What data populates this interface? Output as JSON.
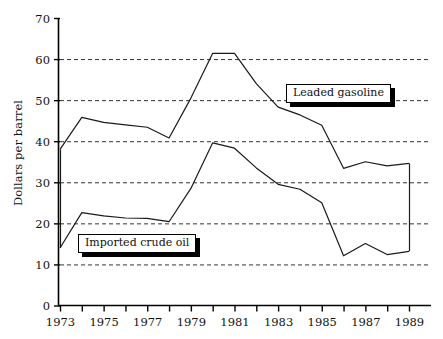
{
  "chart_data": {
    "type": "line",
    "title": "",
    "xlabel": "",
    "ylabel": "Dollars per barrel",
    "xlim": [
      1973,
      1989
    ],
    "ylim": [
      0,
      70
    ],
    "ytick_step": 10,
    "grid": "horizontal-dashed",
    "legend_position": "inline-callouts",
    "x": [
      1973,
      1974,
      1975,
      1976,
      1977,
      1978,
      1979,
      1980,
      1981,
      1982,
      1983,
      1984,
      1985,
      1986,
      1987,
      1988,
      1989
    ],
    "series": [
      {
        "name": "Leaded gasoline",
        "values": [
          38.0,
          45.8,
          44.6,
          44.0,
          43.4,
          40.8,
          50.5,
          61.4,
          61.4,
          54.0,
          48.3,
          46.4,
          43.9,
          33.4,
          35.0,
          34.0,
          34.6
        ]
      },
      {
        "name": "Imported crude oil",
        "values": [
          14.0,
          22.6,
          21.8,
          21.3,
          21.2,
          20.4,
          28.5,
          39.6,
          38.3,
          33.5,
          29.5,
          28.3,
          25.0,
          12.1,
          15.1,
          12.4,
          13.2
        ]
      }
    ],
    "yticks": [
      0,
      10,
      20,
      30,
      40,
      50,
      60,
      70
    ],
    "xticks": [
      1973,
      1974,
      1975,
      1976,
      1977,
      1978,
      1979,
      1980,
      1981,
      1982,
      1983,
      1984,
      1985,
      1986,
      1987,
      1988,
      1989
    ],
    "xtick_labels": [
      "1973",
      "",
      "1975",
      "",
      "1977",
      "",
      "1979",
      "",
      "1981",
      "",
      "1983",
      "",
      "1985",
      "",
      "1987",
      "",
      "1989"
    ],
    "colors": {
      "line": "#1a1a1a",
      "axis": "#000000",
      "grid": "#333333",
      "background": "#ffffff",
      "callout_shadow": "#000000"
    },
    "annotations": [
      {
        "text": "Leaded gasoline",
        "style": "white-box-black-shadow"
      },
      {
        "text": "Imported crude oil",
        "style": "white-box-black-shadow"
      }
    ]
  }
}
